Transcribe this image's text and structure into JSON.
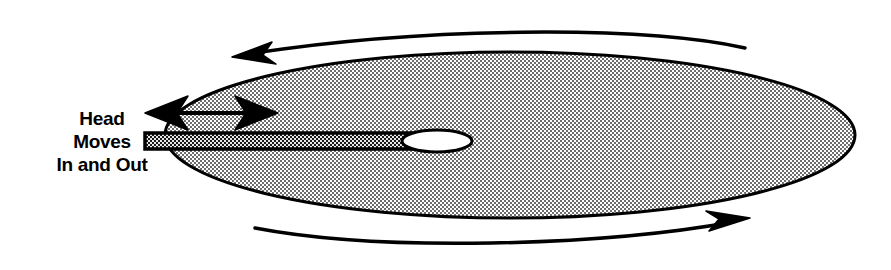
{
  "diagram": {
    "annotation": {
      "name": "head-motion-label",
      "lines": [
        "Head",
        "Moves",
        "In and Out"
      ]
    },
    "parts": [
      {
        "name": "disk-platter",
        "shape": "ellipse",
        "fill_pattern": "stipple-halftone",
        "fill_color": "#cfcfcf",
        "stroke_color": "#000000",
        "center_x": 510,
        "center_y": 135,
        "radius_x": 345,
        "radius_y": 83
      },
      {
        "name": "actuator-arm",
        "shape": "bar",
        "fill_pattern": "checker-crosshatch",
        "fill_color": "#4a4a4a",
        "stroke_color": "#000000",
        "x": 145,
        "y": 133,
        "width": 283,
        "height": 16
      },
      {
        "name": "read-write-head",
        "shape": "ellipse",
        "fill_color": "#ffffff",
        "stroke_color": "#000000",
        "center_x": 437,
        "center_y": 141,
        "radius_x": 35,
        "radius_y": 11
      },
      {
        "name": "head-travel-arrow",
        "shape": "double-headed-arrow",
        "direction": "horizontal-bidirectional",
        "color": "#000000",
        "x1": 152,
        "x2": 272,
        "y": 113
      },
      {
        "name": "rotation-arrow-top",
        "shape": "arc-arrow",
        "direction": "left",
        "color": "#000000"
      },
      {
        "name": "rotation-arrow-bottom",
        "shape": "arc-arrow",
        "direction": "right",
        "color": "#000000"
      }
    ],
    "colors": {
      "ink": "#000000",
      "platter_tone": "#cfcfcf",
      "arm_tone": "#4a4a4a",
      "background": "#ffffff"
    }
  }
}
